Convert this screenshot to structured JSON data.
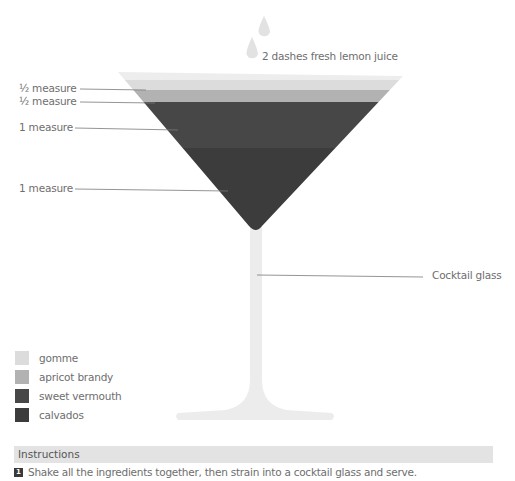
{
  "garnish": {
    "label": "2 dashes fresh lemon juice",
    "icon": "liquid-drop-icon"
  },
  "measures": [
    {
      "label": "½ measure",
      "ingredient": "gomme"
    },
    {
      "label": "½ measure",
      "ingredient": "apricot brandy"
    },
    {
      "label": "1 measure",
      "ingredient": "sweet vermouth"
    },
    {
      "label": "1 measure",
      "ingredient": "calvados"
    }
  ],
  "glass": {
    "label": "Cocktail glass",
    "color": "#ececec"
  },
  "legend": [
    {
      "label": "gomme",
      "color": "#dcdcdc"
    },
    {
      "label": "apricot brandy",
      "color": "#b2b2b2"
    },
    {
      "label": "sweet vermouth",
      "color": "#474747"
    },
    {
      "label": "calvados",
      "color": "#3c3c3c"
    }
  ],
  "instructions": {
    "title": "Instructions",
    "steps": [
      {
        "number": "1",
        "text": "Shake all the ingredients together, then strain into a cocktail glass and serve."
      }
    ]
  },
  "colors": {
    "rim": "#ededed",
    "gomme": "#dcdcdc",
    "apricot": "#b2b2b2",
    "vermouth": "#474747",
    "calvados": "#3c3c3c",
    "leader_line": "#7a7a7a",
    "drop": "#e2e2e2"
  }
}
